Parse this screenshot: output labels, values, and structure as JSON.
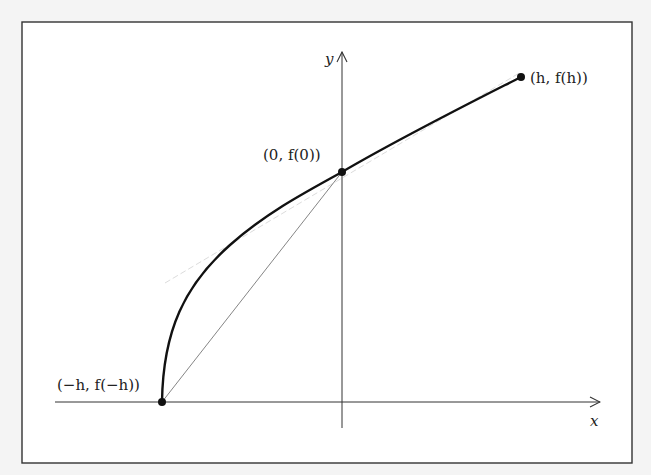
{
  "diagram": {
    "type": "function-plot",
    "axes": {
      "x_label": "x",
      "y_label": "y"
    },
    "points": [
      {
        "id": "left",
        "label": "(−h, f(−h))"
      },
      {
        "id": "origin",
        "label": "(0, f(0))"
      },
      {
        "id": "right",
        "label": "(h, f(h))"
      }
    ],
    "colors": {
      "curve": "#111111",
      "chord": "#777777",
      "tangent": "#dddddd",
      "axes": "#333333",
      "frame": "#333333",
      "background": "#ffffff"
    }
  }
}
